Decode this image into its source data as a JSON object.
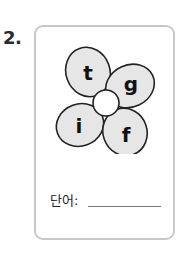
{
  "exercise": {
    "number": "2.",
    "petals": [
      {
        "letter": "t",
        "position": "top-left"
      },
      {
        "letter": "g",
        "position": "top-right"
      },
      {
        "letter": "i",
        "position": "bottom-left"
      },
      {
        "letter": "f",
        "position": "bottom-right"
      }
    ],
    "answer_label": "단어:",
    "answer_value": ""
  },
  "colors": {
    "petal_fill": "#e6e6e6",
    "petal_stroke": "#222222",
    "card_border": "#c8c8c8"
  }
}
